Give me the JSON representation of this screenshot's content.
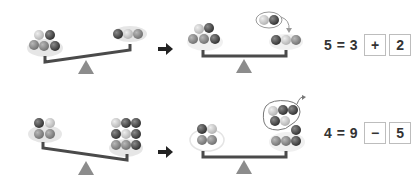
{
  "problems": [
    {
      "id": 1,
      "before": {
        "left_pan_count": 5,
        "right_pan_count": 3,
        "tilt": "left-heavy"
      },
      "after": {
        "left_pan_count": 5,
        "right_pan_count": 3,
        "added_group_count": 2,
        "tilt": "balanced"
      },
      "equation": {
        "lhs": "5",
        "equals": "=",
        "first": "3",
        "operator": "+",
        "second": "2",
        "text": "5 = 3"
      }
    },
    {
      "id": 2,
      "before": {
        "left_pan_count": 4,
        "right_pan_count": 9,
        "tilt": "right-heavy"
      },
      "after": {
        "left_pan_count": 4,
        "right_pan_count": 4,
        "removed_group_count": 5,
        "tilt": "balanced"
      },
      "equation": {
        "lhs": "4",
        "equals": "=",
        "first": "9",
        "operator": "−",
        "second": "5",
        "text": "4 = 9"
      }
    }
  ],
  "icons": {
    "arrow": "right-arrow-icon",
    "fulcrum": "triangle-fulcrum-icon"
  },
  "colors": {
    "beam": "#4a4a4a",
    "fulcrum": "#8c8c8c",
    "pan": "#e8e8e8",
    "ball_dark": "#3d3d3d",
    "ball_mid": "#7d7d7d",
    "ball_light": "#c4c4c4",
    "box_border": "#bdbdbd",
    "text": "#333333"
  }
}
